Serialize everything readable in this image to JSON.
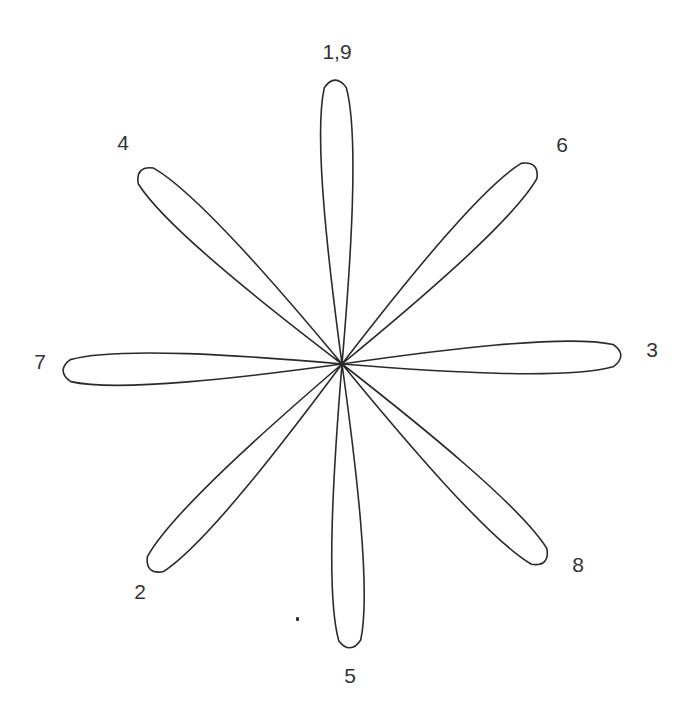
{
  "diagram": {
    "type": "rose-curve",
    "center": [
      342,
      364
    ],
    "stroke_color": "#2a2a2a",
    "label_color": "#333333",
    "petals": [
      {
        "label": "1,9",
        "angle": -91.4,
        "length": 285,
        "label_pos": [
          337,
          52
        ]
      },
      {
        "label": "6",
        "angle": -45.9,
        "length": 277,
        "label_pos": [
          562,
          145
        ]
      },
      {
        "label": "3",
        "angle": -1.8,
        "length": 280,
        "label_pos": [
          652,
          350
        ]
      },
      {
        "label": "8",
        "angle": 44.3,
        "length": 284,
        "label_pos": [
          578,
          565
        ]
      },
      {
        "label": "5",
        "angle": 88.4,
        "length": 285,
        "label_pos": [
          350,
          676
        ]
      },
      {
        "label": "2",
        "angle": 133.0,
        "length": 282,
        "label_pos": [
          140,
          592
        ]
      },
      {
        "label": "7",
        "angle": 178.6,
        "length": 280,
        "label_pos": [
          40,
          362
        ]
      },
      {
        "label": "4",
        "angle": 223.8,
        "length": 280,
        "label_pos": [
          123,
          143
        ]
      }
    ],
    "petal_width": 40
  }
}
